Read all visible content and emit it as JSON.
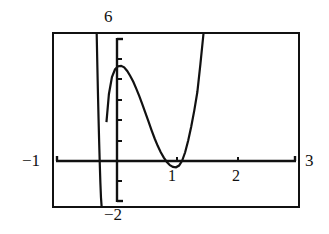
{
  "graph": {
    "kind": "graphing-calculator-screen",
    "window": {
      "xmin_label": "−1",
      "xmax_label": "3",
      "ymin_label": "−2",
      "ymax_label": "6"
    },
    "x_tick_labels": [
      "1",
      "2"
    ]
  },
  "chart_data": {
    "type": "line",
    "title": "",
    "xlabel": "",
    "ylabel": "",
    "xlim": [
      -1,
      3
    ],
    "ylim": [
      -2,
      6
    ],
    "grid": false,
    "legend": null,
    "axis_arrows": true,
    "x_ticks": [
      1,
      2
    ],
    "x_tick_labels": [
      "1",
      "2"
    ],
    "y_ticks": [
      -2,
      -1,
      1,
      2,
      3,
      4,
      5,
      6
    ],
    "y_tick_labels": [],
    "window_corner_labels": {
      "top": "6",
      "bottom": "−2",
      "left": "−1",
      "right": "3"
    },
    "annotations": [
      {
        "text": "6",
        "position": "above-y-axis-top"
      },
      {
        "text": "−2",
        "position": "below-y-axis-bottom"
      },
      {
        "text": "−1",
        "position": "left-of-x-axis-start"
      },
      {
        "text": "3",
        "position": "right-of-x-axis-end"
      },
      {
        "text": "1",
        "position": "below-x-axis-tick-1"
      },
      {
        "text": "2",
        "position": "below-x-axis-tick-2"
      }
    ],
    "series": [
      {
        "name": "curve-left-branch",
        "comment": "steep branch descending off the bottom left of the window",
        "x": [
          -0.3,
          -0.29,
          -0.28,
          -0.27,
          -0.26,
          -0.25,
          -0.24,
          -0.23,
          -0.22
        ],
        "y": [
          6.0,
          4.6,
          3.3,
          2.1,
          1.0,
          0.0,
          -0.9,
          -1.6,
          -2.0
        ]
      },
      {
        "name": "curve-main",
        "comment": "cubic-like curve: rises to local max near x=0.1 then falls to local min near x=1 then rises steeply",
        "x": [
          -0.14,
          -0.1,
          -0.05,
          0.0,
          0.05,
          0.1,
          0.15,
          0.2,
          0.25,
          0.3,
          0.35,
          0.4,
          0.45,
          0.5,
          0.55,
          0.6,
          0.65,
          0.7,
          0.75,
          0.8,
          0.85,
          0.9,
          0.95,
          1.0,
          1.05,
          1.1,
          1.15,
          1.2,
          1.25,
          1.3,
          1.35,
          1.4,
          1.45
        ],
        "y": [
          1.9,
          3.2,
          4.0,
          4.35,
          4.5,
          4.52,
          4.45,
          4.28,
          4.05,
          3.78,
          3.45,
          3.1,
          2.72,
          2.32,
          1.92,
          1.52,
          1.14,
          0.8,
          0.5,
          0.25,
          0.05,
          -0.1,
          -0.18,
          -0.2,
          -0.12,
          0.1,
          0.5,
          1.05,
          1.7,
          2.45,
          3.3,
          4.6,
          6.0
        ]
      }
    ]
  }
}
